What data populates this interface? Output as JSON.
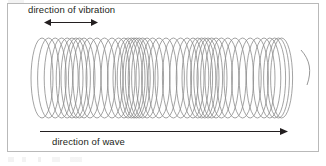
{
  "figure": {
    "frame": {
      "border_color": "#b9b9b9",
      "background": "#ffffff"
    },
    "labels": {
      "vibration": "direction of vibration",
      "wave": "direction of wave"
    },
    "arrows": {
      "vibration": {
        "name": "double-headed-arrow",
        "type": "double",
        "x1": 0,
        "y1": 5,
        "x2": 52,
        "y2": 5,
        "color": "#231f20"
      },
      "wave": {
        "name": "right-arrow",
        "type": "single-right",
        "x1": 0,
        "y1": 5,
        "x2": 245,
        "y2": 5,
        "color": "#231f20"
      }
    },
    "spring": {
      "name": "slinky-coil",
      "stroke_color": "#8c8c8c",
      "stroke_width": 0.8,
      "top_y": 38,
      "bottom_y": 118,
      "center_y": 78,
      "ry": 40,
      "rx": 11,
      "start_x": 42,
      "end_x": 307,
      "coil_count": 46,
      "coil_offsets": [
        0,
        6.6,
        13.2,
        19.6,
        25.2,
        30.0,
        34.0,
        37.4,
        42.0,
        48.0,
        55.0,
        62.5,
        70.0,
        76.6,
        82.0,
        86.2,
        89.4,
        92.0,
        94.4,
        97.2,
        100.6,
        105.0,
        110.6,
        117.0,
        124.0,
        131.4,
        138.6,
        145.2,
        151.0,
        155.8,
        159.6,
        162.8,
        166.0,
        169.6,
        174.0,
        179.4,
        185.8,
        193.0,
        200.6,
        208.2,
        215.4,
        222.0,
        227.8,
        232.6,
        236.4,
        239.6
      ],
      "tail": {
        "from_x": 301,
        "from_y": 50,
        "to_x": 307,
        "to_y": 85
      }
    }
  },
  "chart_data": {
    "type": "line",
    "xlabel": "direction of wave",
    "ylabel": "direction of vibration",
    "annotations": [
      "direction of vibration",
      "direction of wave"
    ],
    "grid": false,
    "legend": "none"
  }
}
